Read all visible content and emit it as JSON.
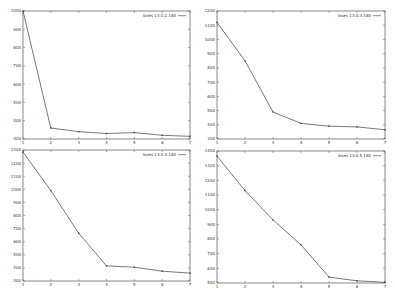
{
  "chart_data": [
    {
      "type": "line",
      "title": "",
      "xlabel": "",
      "ylabel": "",
      "x": [
        1,
        2,
        3,
        4,
        5,
        6,
        7
      ],
      "series": [
        {
          "name": "loses 13.0.2.180",
          "values": [
            1000,
            360,
            340,
            330,
            335,
            320,
            315
          ]
        }
      ],
      "ylim": [
        300,
        1000
      ],
      "yticks": [
        300,
        400,
        500,
        600,
        700,
        800,
        900,
        1000
      ],
      "xticks": [
        1,
        2,
        3,
        4,
        5,
        6,
        7
      ],
      "grid": false,
      "legend_position": "top-right"
    },
    {
      "type": "line",
      "title": "",
      "xlabel": "",
      "ylabel": "",
      "x": [
        1,
        2,
        3,
        4,
        5,
        6,
        7
      ],
      "series": [
        {
          "name": "loses 13.0.3.180",
          "values": [
            1120,
            850,
            490,
            410,
            390,
            385,
            365
          ]
        }
      ],
      "ylim": [
        300,
        1200
      ],
      "yticks": [
        300,
        400,
        500,
        600,
        700,
        800,
        900,
        1000,
        1100,
        1200
      ],
      "xticks": [
        1,
        2,
        3,
        4,
        5,
        6,
        7
      ],
      "grid": false,
      "legend_position": "top-right"
    },
    {
      "type": "line",
      "title": "",
      "xlabel": "",
      "ylabel": "",
      "x": [
        1,
        2,
        3,
        4,
        5,
        6,
        7
      ],
      "series": [
        {
          "name": "loses 13.0.4.180",
          "values": [
            1285,
            990,
            665,
            415,
            405,
            375,
            360
          ]
        }
      ],
      "ylim": [
        300,
        1300
      ],
      "yticks": [
        300,
        400,
        500,
        600,
        700,
        800,
        900,
        1000,
        1100,
        1200,
        1300
      ],
      "xticks": [
        1,
        2,
        3,
        4,
        5,
        6,
        7
      ],
      "grid": false,
      "legend_position": "top-right"
    },
    {
      "type": "line",
      "title": "",
      "xlabel": "",
      "ylabel": "",
      "x": [
        1,
        2,
        3,
        4,
        5,
        6,
        7
      ],
      "series": [
        {
          "name": "loses 13.0.5.180",
          "values": [
            1365,
            1130,
            930,
            760,
            540,
            515,
            505
          ]
        }
      ],
      "ylim": [
        500,
        1400
      ],
      "yticks": [
        500,
        600,
        700,
        800,
        900,
        1000,
        1100,
        1200,
        1300,
        1400
      ],
      "xticks": [
        1,
        2,
        3,
        4,
        5,
        6,
        7
      ],
      "grid": false,
      "legend_position": "top-right"
    }
  ],
  "panels": [
    {
      "legend": "loses 13.0.2.180"
    },
    {
      "legend": "loses 13.0.3.180"
    },
    {
      "legend": "loses 13.0.4.180"
    },
    {
      "legend": "loses 13.0.5.180"
    }
  ]
}
